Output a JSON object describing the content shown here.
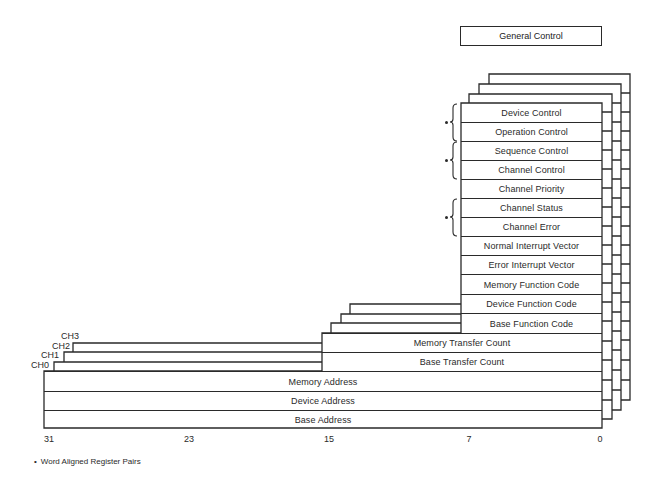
{
  "general_control": {
    "label": "General Control"
  },
  "channels": [
    "CH3",
    "CH2",
    "CH1",
    "CH0"
  ],
  "registers_8bit": [
    {
      "label": "Device Control"
    },
    {
      "label": "Operation Control"
    },
    {
      "label": "Sequence Control"
    },
    {
      "label": "Channel Control"
    },
    {
      "label": "Channel Priority"
    },
    {
      "label": "Channel Status"
    },
    {
      "label": "Channel Error"
    },
    {
      "label": "Normal Interrupt Vector"
    },
    {
      "label": "Error Interrupt Vector"
    },
    {
      "label": "Memory Function Code"
    },
    {
      "label": "Device Function Code"
    },
    {
      "label": "Base Function Code"
    }
  ],
  "registers_16bit": [
    {
      "label": "Memory Transfer Count"
    },
    {
      "label": "Base Transfer Count"
    }
  ],
  "registers_32bit": [
    {
      "label": "Memory Address"
    },
    {
      "label": "Device Address"
    },
    {
      "label": "Base Address"
    }
  ],
  "word_aligned_pairs": [
    [
      "Device Control",
      "Operation Control"
    ],
    [
      "Sequence Control",
      "Channel Control"
    ],
    [
      "Channel Status",
      "Channel Error"
    ]
  ],
  "bit_axis": [
    "31",
    "23",
    "15",
    "7",
    "0"
  ],
  "footnote": {
    "bullet": "•",
    "text": "Word Aligned Register Pairs"
  }
}
